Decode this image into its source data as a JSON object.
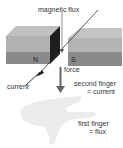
{
  "diagram": {
    "labels": {
      "magnetic_flux": "magnetic flux",
      "force": "force",
      "current": "current",
      "second_finger_line1": "second finger",
      "second_finger_line2": "= current",
      "first_finger_line1": "first finger",
      "first_finger_line2": "= flux",
      "north_pole": "N",
      "south_pole": "S"
    },
    "colors": {
      "magnet_top": "#b8b8b8",
      "magnet_front": "#7a7a7a",
      "magnet_end": "#222222",
      "hand": "#ebebeb",
      "arrow": "#555555",
      "wire": "#333333"
    }
  }
}
